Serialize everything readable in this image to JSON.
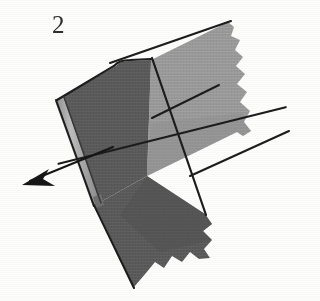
{
  "figure": {
    "number_label": "2",
    "caption_text": "2",
    "background_color": "#fdfdfc",
    "ink_color": "#1c1c1c"
  },
  "colors": {
    "dark_panel": "#5a5a5a",
    "dark_panel_shade": "#4e4e4e",
    "light_panel": "#9a9a9a",
    "light_panel_shade": "#8d8d8d",
    "hem_strip": "#b4b4b4",
    "hem_strip_edge": "#7d7d7d",
    "outline": "#1c1c1c",
    "arrow": "#161616",
    "paper": "#fdfdfc"
  },
  "shapes": {
    "light_panel": {
      "name": "light-gray-fabric-panel",
      "fill": "#9a9a9a",
      "points": "152,60 226,22 237,25 243,38 232,50 243,63 236,78 246,90 240,106 252,120 246,134 239,133 148,175"
    },
    "dark_panel_upper": {
      "name": "dark-gray-fabric-panel-upper",
      "fill": "#5a5a5a",
      "points": "152,60 148,175 58,100 62,96 122,65"
    },
    "dark_panel_lower": {
      "name": "dark-gray-fabric-panel-lower",
      "fill": "#585858",
      "points": "148,175 208,216 214,228 205,238 213,250 206,262 196,257 186,268 177,262 168,272 160,266 152,274 130,286 92,205"
    },
    "hem_strip": {
      "name": "left-hem-strip",
      "fill": "#b4b4b4",
      "points": "56,100 62,97 98,203 92,206"
    }
  },
  "lines": {
    "top_edge": {
      "name": "top-edge-line",
      "x1": 110,
      "y1": 62,
      "x2": 231,
      "y2": 22
    },
    "seam_horizontal": {
      "name": "horizontal-seam-line",
      "x1": 56,
      "y1": 139,
      "x2": 284,
      "y2": 90
    },
    "seam_horizontal_right": {
      "name": "horizontal-seam-line-right",
      "x1": 150,
      "y1": 120,
      "x2": 217,
      "y2": 86
    },
    "right_lower_edge": {
      "name": "lower-right-edge-line",
      "x1": 190,
      "y1": 175,
      "x2": 288,
      "y2": 132
    },
    "seam_vertical": {
      "name": "vertical-seam-line",
      "x1": 152,
      "y1": 59,
      "x2": 130,
      "y2": 287
    },
    "left_outline": {
      "name": "left-outline-line",
      "x1": 57,
      "y1": 100,
      "x2": 95,
      "y2": 207
    },
    "hem_inner": {
      "name": "hem-inner-line",
      "x1": 62,
      "y1": 98,
      "x2": 99,
      "y2": 204
    },
    "bottom_left_edge": {
      "name": "bottom-left-edge-line",
      "x1": 95,
      "y1": 205,
      "x2": 131,
      "y2": 287
    }
  },
  "arrow": {
    "name": "direction-arrow",
    "description": "arrow-pointing-down-left",
    "tail_x": 112,
    "tail_y": 148,
    "tip_x": 23,
    "tip_y": 184,
    "head_points": "23,184 47,170 41,180 52,187"
  },
  "annotations": {
    "figure_label_position": "top-left",
    "arrow_direction": "down-left"
  }
}
